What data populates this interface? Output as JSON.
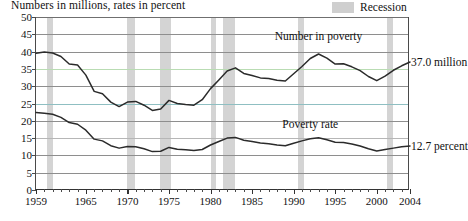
{
  "chart_data": {
    "type": "line",
    "title": "Numbers in millions, rates in percent",
    "xlabel": "",
    "ylabel": "",
    "xlim": [
      1959,
      2004
    ],
    "ylim": [
      0,
      50
    ],
    "grid": true,
    "legend_position": "top-right",
    "y_ticks": [
      0,
      5,
      10,
      15,
      20,
      25,
      30,
      35,
      40,
      45,
      50
    ],
    "x_tick_labels": [
      "1959",
      "1965",
      "1970",
      "1975",
      "1980",
      "1985",
      "1990",
      "1995",
      "2000",
      "2004"
    ],
    "x": [
      1959,
      1960,
      1961,
      1962,
      1963,
      1964,
      1965,
      1966,
      1967,
      1968,
      1969,
      1970,
      1971,
      1972,
      1973,
      1974,
      1975,
      1976,
      1977,
      1978,
      1979,
      1980,
      1981,
      1982,
      1983,
      1984,
      1985,
      1986,
      1987,
      1988,
      1989,
      1990,
      1991,
      1992,
      1993,
      1994,
      1995,
      1996,
      1997,
      1998,
      1999,
      2000,
      2001,
      2002,
      2003,
      2004
    ],
    "series": [
      {
        "name": "Number in poverty",
        "units": "millions",
        "end_label": "37.0 million",
        "values": [
          39.5,
          39.9,
          39.6,
          38.6,
          36.4,
          36.1,
          33.2,
          28.5,
          27.8,
          25.4,
          24.1,
          25.4,
          25.6,
          24.5,
          23.0,
          23.4,
          25.9,
          25.0,
          24.7,
          24.5,
          26.1,
          29.3,
          31.8,
          34.4,
          35.3,
          33.7,
          33.1,
          32.4,
          32.2,
          31.7,
          31.5,
          33.6,
          35.7,
          38.0,
          39.3,
          38.1,
          36.4,
          36.5,
          35.6,
          34.5,
          32.8,
          31.6,
          32.9,
          34.6,
          35.9,
          37.0
        ]
      },
      {
        "name": "Poverty rate",
        "units": "percent",
        "end_label": "12.7 percent",
        "values": [
          22.4,
          22.2,
          21.9,
          21.0,
          19.5,
          19.0,
          17.3,
          14.7,
          14.2,
          12.8,
          12.1,
          12.6,
          12.5,
          11.9,
          11.1,
          11.2,
          12.3,
          11.8,
          11.6,
          11.4,
          11.7,
          13.0,
          14.0,
          15.0,
          15.2,
          14.4,
          14.0,
          13.6,
          13.4,
          13.0,
          12.8,
          13.5,
          14.2,
          14.8,
          15.1,
          14.5,
          13.8,
          13.7,
          13.3,
          12.7,
          11.9,
          11.3,
          11.7,
          12.1,
          12.5,
          12.7
        ]
      }
    ],
    "recessions": [
      {
        "start": 1960.3,
        "end": 1961.1
      },
      {
        "start": 1969.9,
        "end": 1970.9
      },
      {
        "start": 1973.9,
        "end": 1975.2
      },
      {
        "start": 1980.0,
        "end": 1980.6
      },
      {
        "start": 1981.5,
        "end": 1982.9
      },
      {
        "start": 1990.5,
        "end": 1991.2
      },
      {
        "start": 2001.2,
        "end": 2001.9
      }
    ],
    "annotations": [
      {
        "text": "Number in poverty",
        "x": 1993.0,
        "y": 44.5
      },
      {
        "text": "Poverty rate",
        "x": 1992.0,
        "y": 19.0
      }
    ],
    "legend": [
      {
        "label": "Recession",
        "color": "#d2d2d2",
        "type": "band"
      }
    ],
    "colors": {
      "number_in_poverty_line": "#2b2b2b",
      "poverty_rate_line": "#2b2b2b",
      "recession_band": "#d2d2d2",
      "gridline": "#8e8e8e",
      "gridline_35": "#b9dcb3",
      "gridline_25": "#8fbfc2",
      "axis": "#4a4a4a"
    }
  }
}
